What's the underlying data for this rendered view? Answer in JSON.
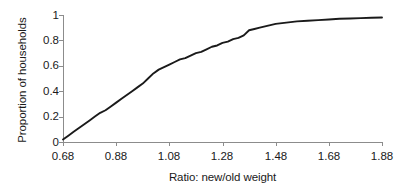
{
  "chart_data": {
    "type": "line",
    "title": "",
    "xlabel": "Ratio: new/old weight",
    "ylabel": "Proportion of households",
    "xlim": [
      0.68,
      1.88
    ],
    "ylim": [
      0,
      1
    ],
    "xticks": [
      "0.68",
      "0.88",
      "1.08",
      "1.28",
      "1.48",
      "1.68",
      "1.88"
    ],
    "xtick_values": [
      0.68,
      0.88,
      1.08,
      1.28,
      1.48,
      1.68,
      1.88
    ],
    "yticks": [
      "0",
      "0.2",
      "0.4",
      "0.6",
      "0.8",
      "1"
    ],
    "ytick_values": [
      0,
      0.2,
      0.4,
      0.6,
      0.8,
      1
    ],
    "grid": false,
    "legend": false,
    "line_color": "#1a1a1a",
    "axis_color": "#8c8c8c",
    "series": [
      {
        "name": "Cumulative proportion of households",
        "x": [
          0.68,
          0.7,
          0.72,
          0.74,
          0.76,
          0.78,
          0.8,
          0.82,
          0.84,
          0.86,
          0.88,
          0.9,
          0.92,
          0.94,
          0.96,
          0.98,
          1.0,
          1.02,
          1.04,
          1.06,
          1.08,
          1.1,
          1.12,
          1.14,
          1.16,
          1.18,
          1.2,
          1.22,
          1.24,
          1.26,
          1.28,
          1.3,
          1.32,
          1.34,
          1.36,
          1.38,
          1.4,
          1.42,
          1.44,
          1.46,
          1.48,
          1.52,
          1.56,
          1.6,
          1.64,
          1.68,
          1.72,
          1.76,
          1.8,
          1.84,
          1.88
        ],
        "values": [
          0.02,
          0.05,
          0.08,
          0.11,
          0.14,
          0.17,
          0.2,
          0.23,
          0.25,
          0.28,
          0.31,
          0.34,
          0.37,
          0.4,
          0.43,
          0.46,
          0.5,
          0.54,
          0.57,
          0.59,
          0.61,
          0.63,
          0.65,
          0.66,
          0.68,
          0.7,
          0.71,
          0.73,
          0.75,
          0.76,
          0.78,
          0.79,
          0.81,
          0.82,
          0.84,
          0.88,
          0.89,
          0.9,
          0.91,
          0.92,
          0.93,
          0.94,
          0.95,
          0.955,
          0.96,
          0.965,
          0.97,
          0.972,
          0.975,
          0.978,
          0.98
        ]
      }
    ]
  },
  "axis_titles": {
    "x": "Ratio: new/old weight",
    "y": "Proportion of households"
  }
}
